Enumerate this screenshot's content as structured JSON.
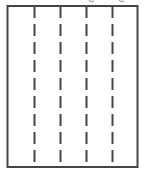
{
  "diagram": {
    "type": "column-grid",
    "column_count": 5,
    "separator_count": 4,
    "separator_style": "dashed",
    "frame_style": "solid",
    "colors": {
      "line": "#454545",
      "background": "#ffffff"
    },
    "clipped_caption_descenders": 2
  }
}
